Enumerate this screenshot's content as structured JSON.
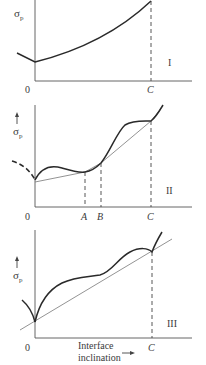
{
  "figure": {
    "panels": [
      {
        "id": "I",
        "panel_label": "I",
        "y_axis_label": "σ",
        "y_axis_subscript": "p",
        "origin_label": "0",
        "x_markers": [
          "C"
        ]
      },
      {
        "id": "II",
        "panel_label": "II",
        "y_axis_label": "σ",
        "y_axis_subscript": "p",
        "origin_label": "0",
        "x_markers": [
          "A",
          "B",
          "C"
        ]
      },
      {
        "id": "III",
        "panel_label": "III",
        "y_axis_label": "σ",
        "y_axis_subscript": "p",
        "origin_label": "0",
        "x_markers": [
          "C"
        ],
        "x_axis_label_line1": "Interface",
        "x_axis_label_line2": "inclination"
      }
    ],
    "colors": {
      "curve": "#2a2a2a",
      "axis": "#555555",
      "tangent": "#777777",
      "text": "#3a3a3a"
    }
  }
}
